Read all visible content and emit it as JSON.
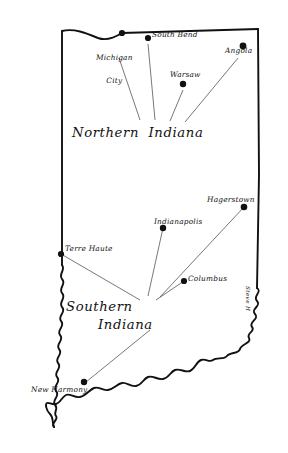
{
  "map": {
    "title": "Indiana",
    "style": "hand-drawn ink outline map",
    "colors": {
      "ink": "#111111",
      "background": "#ffffff",
      "leader_line": "#555555"
    },
    "regions": [
      {
        "name": "northern-indiana",
        "label": "Northern  Indiana"
      },
      {
        "name": "southern-indiana",
        "label_line1": "Southern",
        "label_line2": "Indiana"
      }
    ],
    "cities": [
      {
        "name": "michigan-city",
        "label_line1": "Michigan",
        "label_line2": "City",
        "region": "northern-indiana"
      },
      {
        "name": "south-bend",
        "label": "South Bend",
        "region": "northern-indiana"
      },
      {
        "name": "angola",
        "label": "Angola",
        "region": "northern-indiana"
      },
      {
        "name": "warsaw",
        "label": "Warsaw",
        "region": "northern-indiana"
      },
      {
        "name": "hagerstown",
        "label": "Hagerstown",
        "region": "southern-indiana"
      },
      {
        "name": "indianapolis",
        "label": "Indianapolis",
        "region": "southern-indiana"
      },
      {
        "name": "terre-haute",
        "label": "Terre Haute",
        "region": "southern-indiana"
      },
      {
        "name": "columbus",
        "label": "Columbus",
        "region": "southern-indiana"
      },
      {
        "name": "new-harmony",
        "label": "New Harmony",
        "region": "southern-indiana"
      }
    ],
    "signature": "Steve H"
  }
}
